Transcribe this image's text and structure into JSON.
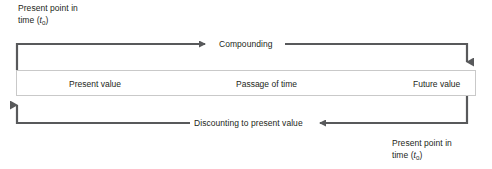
{
  "diagram": {
    "colors": {
      "line": "#58595b",
      "text": "#231f20",
      "bar_border": "#c9c9c9",
      "background": "#ffffff"
    },
    "top_label": {
      "line1": "Present point in",
      "line2_prefix": "time (",
      "line2_var": "t",
      "line2_sub": "0",
      "line2_suffix": ")"
    },
    "bottom_label": {
      "line1": "Present point in",
      "line2_prefix": "time (",
      "line2_var": "t",
      "line2_sub": "0",
      "line2_suffix": ")"
    },
    "compounding_label": "Compounding",
    "discounting_label": "Discounting to present value",
    "bar": {
      "cells": [
        {
          "label": "Present value"
        },
        {
          "label": "Passage of time"
        },
        {
          "label": "Future value"
        }
      ]
    }
  }
}
